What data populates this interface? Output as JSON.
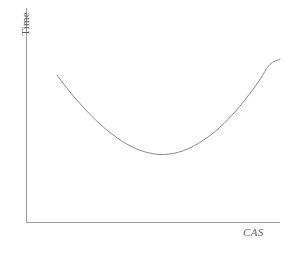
{
  "figure": {
    "background_color": "#ffffff",
    "axis_color": "#9a9a9a",
    "curve_color": "#8a8a8a",
    "label_color": "#5b5b5b"
  },
  "axes": {
    "y_label": "Time",
    "x_label": "CAS"
  },
  "chart_data": {
    "type": "line",
    "title": "",
    "subtitle": "",
    "xlabel": "CAS",
    "ylabel": "Time",
    "grid": false,
    "legend": null,
    "xticks": [],
    "yticks": [],
    "xlim": [
      0,
      1
    ],
    "ylim": [
      0,
      1
    ],
    "annotations": [],
    "series": [
      {
        "name": "Time vs CAS",
        "x": [
          0.122,
          0.16,
          0.2,
          0.24,
          0.28,
          0.32,
          0.36,
          0.4,
          0.44,
          0.48,
          0.52,
          0.56,
          0.6,
          0.64,
          0.68,
          0.72,
          0.76,
          0.8,
          0.84,
          0.88,
          0.92,
          0.96,
          1.0
        ],
        "y": [
          0.687,
          0.627,
          0.57,
          0.518,
          0.47,
          0.428,
          0.392,
          0.362,
          0.339,
          0.324,
          0.316,
          0.317,
          0.326,
          0.343,
          0.368,
          0.4,
          0.439,
          0.485,
          0.538,
          0.598,
          0.664,
          0.736,
          0.761
        ]
      }
    ]
  }
}
